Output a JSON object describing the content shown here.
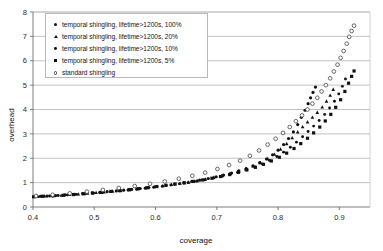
{
  "chart_data": {
    "type": "scatter",
    "title": "",
    "xlabel": "coverage",
    "ylabel": "overhead",
    "xlim": [
      0.4,
      0.95
    ],
    "ylim": [
      0,
      8
    ],
    "xticks": [
      0.4,
      0.5,
      0.6,
      0.7,
      0.8,
      0.9
    ],
    "xtick_labels": [
      "0.4",
      "0.5",
      "0.6",
      "0.7",
      "0.8",
      "0.9"
    ],
    "yticks": [
      0,
      1,
      2,
      3,
      4,
      5,
      6,
      7,
      8
    ],
    "ytick_labels": [
      "0",
      "1",
      "2",
      "3",
      "4",
      "5",
      "6",
      "7",
      "8"
    ],
    "grid": "horizontal",
    "legend_position": "top-left",
    "series": [
      {
        "name": "temporal shingling, lifetime>1200s, 100%",
        "marker": "filled-circle",
        "color": "#111111",
        "points": [
          [
            0.404,
            0.42
          ],
          [
            0.412,
            0.44
          ],
          [
            0.423,
            0.45
          ],
          [
            0.437,
            0.47
          ],
          [
            0.452,
            0.5
          ],
          [
            0.468,
            0.52
          ],
          [
            0.481,
            0.55
          ],
          [
            0.497,
            0.58
          ],
          [
            0.509,
            0.6
          ],
          [
            0.521,
            0.63
          ],
          [
            0.536,
            0.66
          ],
          [
            0.548,
            0.69
          ],
          [
            0.561,
            0.72
          ],
          [
            0.575,
            0.76
          ],
          [
            0.589,
            0.8
          ],
          [
            0.602,
            0.84
          ],
          [
            0.617,
            0.89
          ],
          [
            0.631,
            0.94
          ],
          [
            0.646,
            0.99
          ],
          [
            0.659,
            1.05
          ],
          [
            0.672,
            1.1
          ],
          [
            0.686,
            1.17
          ],
          [
            0.699,
            1.24
          ],
          [
            0.711,
            1.31
          ],
          [
            0.724,
            1.39
          ],
          [
            0.736,
            1.48
          ],
          [
            0.748,
            1.58
          ],
          [
            0.759,
            1.69
          ],
          [
            0.77,
            1.82
          ],
          [
            0.781,
            1.97
          ],
          [
            0.791,
            2.14
          ],
          [
            0.8,
            2.33
          ],
          [
            0.809,
            2.56
          ],
          [
            0.817,
            2.81
          ],
          [
            0.825,
            3.08
          ],
          [
            0.832,
            3.38
          ],
          [
            0.838,
            3.68
          ],
          [
            0.844,
            3.97
          ],
          [
            0.849,
            4.24
          ],
          [
            0.853,
            4.48
          ],
          [
            0.857,
            4.7
          ],
          [
            0.861,
            4.92
          ]
        ]
      },
      {
        "name": "temporal shingling, lifetime>1200s, 20%",
        "marker": "filled-triangle",
        "color": "#111111",
        "points": [
          [
            0.408,
            0.43
          ],
          [
            0.419,
            0.45
          ],
          [
            0.431,
            0.46
          ],
          [
            0.446,
            0.48
          ],
          [
            0.46,
            0.51
          ],
          [
            0.474,
            0.53
          ],
          [
            0.489,
            0.56
          ],
          [
            0.503,
            0.59
          ],
          [
            0.516,
            0.62
          ],
          [
            0.53,
            0.65
          ],
          [
            0.543,
            0.68
          ],
          [
            0.557,
            0.71
          ],
          [
            0.57,
            0.75
          ],
          [
            0.584,
            0.79
          ],
          [
            0.598,
            0.83
          ],
          [
            0.612,
            0.87
          ],
          [
            0.626,
            0.92
          ],
          [
            0.64,
            0.97
          ],
          [
            0.654,
            1.02
          ],
          [
            0.668,
            1.08
          ],
          [
            0.681,
            1.14
          ],
          [
            0.695,
            1.21
          ],
          [
            0.708,
            1.29
          ],
          [
            0.721,
            1.37
          ],
          [
            0.734,
            1.46
          ],
          [
            0.747,
            1.56
          ],
          [
            0.759,
            1.68
          ],
          [
            0.771,
            1.82
          ],
          [
            0.783,
            1.98
          ],
          [
            0.794,
            2.16
          ],
          [
            0.804,
            2.37
          ],
          [
            0.814,
            2.6
          ],
          [
            0.823,
            2.84
          ],
          [
            0.832,
            3.08
          ],
          [
            0.84,
            3.29
          ],
          [
            0.848,
            3.49
          ],
          [
            0.856,
            3.68
          ],
          [
            0.864,
            3.88
          ],
          [
            0.872,
            4.1
          ],
          [
            0.879,
            4.34
          ],
          [
            0.885,
            4.58
          ],
          [
            0.89,
            4.82
          ]
        ]
      },
      {
        "name": "temporal shingling, lifetime>1200s, 10%",
        "marker": "filled-circle-small",
        "color": "#111111",
        "points": [
          [
            0.414,
            0.44
          ],
          [
            0.427,
            0.45
          ],
          [
            0.441,
            0.47
          ],
          [
            0.456,
            0.49
          ],
          [
            0.471,
            0.52
          ],
          [
            0.485,
            0.54
          ],
          [
            0.499,
            0.57
          ],
          [
            0.513,
            0.6
          ],
          [
            0.527,
            0.63
          ],
          [
            0.541,
            0.66
          ],
          [
            0.555,
            0.7
          ],
          [
            0.569,
            0.73
          ],
          [
            0.583,
            0.77
          ],
          [
            0.597,
            0.81
          ],
          [
            0.611,
            0.85
          ],
          [
            0.625,
            0.9
          ],
          [
            0.639,
            0.95
          ],
          [
            0.653,
            1.0
          ],
          [
            0.667,
            1.06
          ],
          [
            0.681,
            1.12
          ],
          [
            0.695,
            1.19
          ],
          [
            0.709,
            1.26
          ],
          [
            0.722,
            1.34
          ],
          [
            0.736,
            1.43
          ],
          [
            0.749,
            1.53
          ],
          [
            0.762,
            1.64
          ],
          [
            0.774,
            1.77
          ],
          [
            0.786,
            1.91
          ],
          [
            0.798,
            2.07
          ],
          [
            0.809,
            2.25
          ],
          [
            0.82,
            2.45
          ],
          [
            0.83,
            2.66
          ],
          [
            0.84,
            2.88
          ],
          [
            0.849,
            3.1
          ],
          [
            0.858,
            3.32
          ],
          [
            0.867,
            3.55
          ],
          [
            0.876,
            3.8
          ],
          [
            0.884,
            4.06
          ],
          [
            0.892,
            4.34
          ],
          [
            0.899,
            4.64
          ],
          [
            0.905,
            4.95
          ],
          [
            0.91,
            5.25
          ]
        ]
      },
      {
        "name": "temporal shingling, lifetime>1200s, 5%",
        "marker": "filled-square",
        "color": "#111111",
        "points": [
          [
            0.401,
            0.42
          ],
          [
            0.416,
            0.44
          ],
          [
            0.433,
            0.46
          ],
          [
            0.45,
            0.48
          ],
          [
            0.466,
            0.51
          ],
          [
            0.482,
            0.54
          ],
          [
            0.497,
            0.57
          ],
          [
            0.512,
            0.6
          ],
          [
            0.527,
            0.64
          ],
          [
            0.542,
            0.67
          ],
          [
            0.557,
            0.71
          ],
          [
            0.572,
            0.75
          ],
          [
            0.587,
            0.79
          ],
          [
            0.602,
            0.84
          ],
          [
            0.617,
            0.89
          ],
          [
            0.632,
            0.94
          ],
          [
            0.647,
            0.99
          ],
          [
            0.662,
            1.05
          ],
          [
            0.677,
            1.11
          ],
          [
            0.692,
            1.18
          ],
          [
            0.706,
            1.25
          ],
          [
            0.721,
            1.33
          ],
          [
            0.735,
            1.42
          ],
          [
            0.749,
            1.52
          ],
          [
            0.763,
            1.63
          ],
          [
            0.776,
            1.75
          ],
          [
            0.789,
            1.89
          ],
          [
            0.802,
            2.04
          ],
          [
            0.814,
            2.21
          ],
          [
            0.826,
            2.4
          ],
          [
            0.837,
            2.6
          ],
          [
            0.848,
            2.82
          ],
          [
            0.858,
            3.04
          ],
          [
            0.868,
            3.28
          ],
          [
            0.877,
            3.53
          ],
          [
            0.886,
            3.8
          ],
          [
            0.894,
            4.09
          ],
          [
            0.902,
            4.4
          ],
          [
            0.909,
            4.74
          ],
          [
            0.915,
            5.08
          ],
          [
            0.92,
            5.36
          ],
          [
            0.924,
            5.58
          ]
        ]
      },
      {
        "name": "standard shingling",
        "marker": "open-circle",
        "color": "#3a3a3a",
        "points": [
          [
            0.405,
            0.45
          ],
          [
            0.432,
            0.5
          ],
          [
            0.46,
            0.56
          ],
          [
            0.488,
            0.63
          ],
          [
            0.514,
            0.7
          ],
          [
            0.54,
            0.78
          ],
          [
            0.566,
            0.86
          ],
          [
            0.591,
            0.95
          ],
          [
            0.615,
            1.05
          ],
          [
            0.638,
            1.16
          ],
          [
            0.66,
            1.28
          ],
          [
            0.681,
            1.41
          ],
          [
            0.701,
            1.56
          ],
          [
            0.72,
            1.72
          ],
          [
            0.738,
            1.9
          ],
          [
            0.754,
            2.1
          ],
          [
            0.769,
            2.32
          ],
          [
            0.783,
            2.56
          ],
          [
            0.796,
            2.8
          ],
          [
            0.808,
            3.04
          ],
          [
            0.819,
            3.28
          ],
          [
            0.829,
            3.52
          ],
          [
            0.839,
            3.76
          ],
          [
            0.848,
            4.0
          ],
          [
            0.856,
            4.24
          ],
          [
            0.864,
            4.48
          ],
          [
            0.871,
            4.74
          ],
          [
            0.878,
            5.0
          ],
          [
            0.885,
            5.28
          ],
          [
            0.891,
            5.56
          ],
          [
            0.897,
            5.84
          ],
          [
            0.902,
            6.12
          ],
          [
            0.907,
            6.4
          ],
          [
            0.912,
            6.7
          ],
          [
            0.916,
            6.98
          ],
          [
            0.92,
            7.22
          ],
          [
            0.924,
            7.44
          ]
        ]
      }
    ]
  },
  "legend": {
    "items": [
      {
        "label": "temporal shingling, lifetime>1200s, 100%",
        "marker": "filled-circle"
      },
      {
        "label": "temporal shingling, lifetime>1200s, 20%",
        "marker": "filled-triangle"
      },
      {
        "label": "temporal shingling, lifetime>1200s, 10%",
        "marker": "filled-circle-small"
      },
      {
        "label": "temporal shingling, lifetime>1200s, 5%",
        "marker": "filled-square"
      },
      {
        "label": "standard shingling",
        "marker": "open-circle"
      }
    ]
  }
}
